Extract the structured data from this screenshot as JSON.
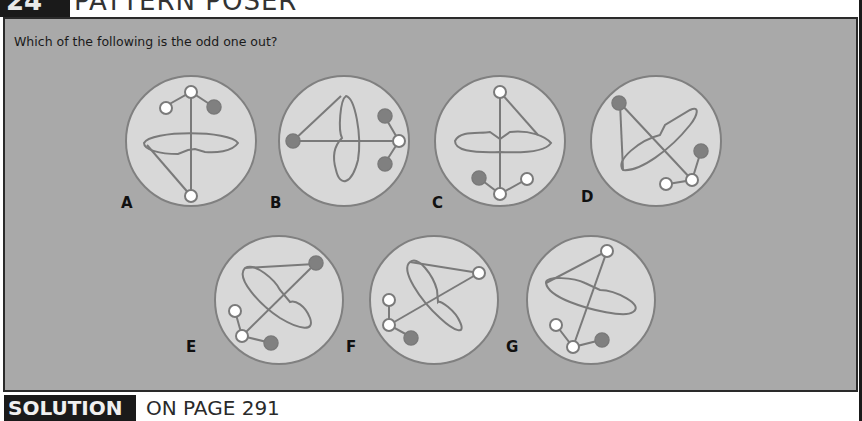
{
  "header": {
    "puzzle_number": "24",
    "title": "PATTERN POSER"
  },
  "question": "Which of the following is the odd one out?",
  "options": [
    {
      "label": "A"
    },
    {
      "label": "B"
    },
    {
      "label": "C"
    },
    {
      "label": "D"
    },
    {
      "label": "E"
    },
    {
      "label": "F"
    },
    {
      "label": "G"
    }
  ],
  "footer": {
    "tag": "SOLUTION",
    "text": "ON PAGE 291"
  },
  "colors": {
    "panel_bg": "#a9a9a9",
    "circle_fill": "#d8d8d8",
    "stroke": "#7a7a7a",
    "dot_dark": "#808080",
    "dot_light": "#ffffff",
    "header_dark": "#1a1a1a"
  }
}
